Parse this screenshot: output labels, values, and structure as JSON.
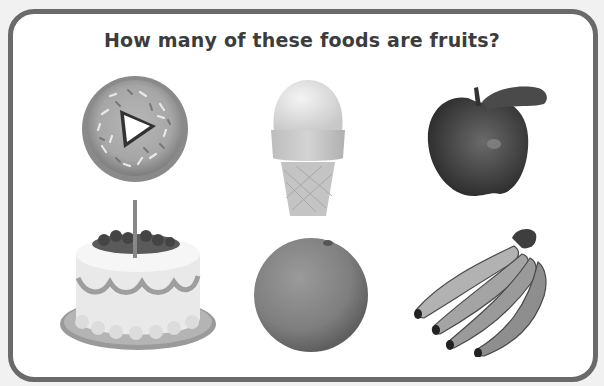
{
  "question": {
    "title": "How many of these foods are fruits?"
  },
  "foods": [
    {
      "name": "donut",
      "is_fruit": false
    },
    {
      "name": "ice cream cone",
      "is_fruit": false
    },
    {
      "name": "apple",
      "is_fruit": true
    },
    {
      "name": "birthday cake",
      "is_fruit": false
    },
    {
      "name": "orange",
      "is_fruit": true
    },
    {
      "name": "bananas",
      "is_fruit": true
    }
  ],
  "colors": {
    "border": "#6a6a6a",
    "title": "#3c3c3c",
    "background": "#ffffff"
  }
}
